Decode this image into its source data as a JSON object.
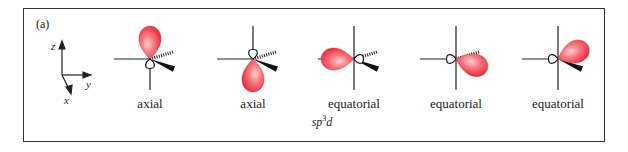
{
  "figure": {
    "panel_label": "(a)",
    "hybridization": {
      "base": "sp",
      "superscript": "3",
      "suffix": "d"
    },
    "axes": {
      "z": "z",
      "y": "y",
      "x": "x"
    },
    "orbitals": [
      {
        "label": "axial",
        "lobe_direction": "up"
      },
      {
        "label": "axial",
        "lobe_direction": "down"
      },
      {
        "label": "equatorial",
        "lobe_direction": "left"
      },
      {
        "label": "equatorial",
        "lobe_direction": "lower-right (hashed bond)"
      },
      {
        "label": "equatorial",
        "lobe_direction": "upper-right (wedge bond)"
      }
    ],
    "colors": {
      "lobe": "#f0505a",
      "lobe_highlight": "#ffc4c8",
      "line": "#222222",
      "frame": "#333333"
    }
  }
}
